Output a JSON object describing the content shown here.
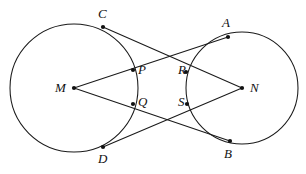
{
  "figure": {
    "width": 306,
    "height": 174,
    "background_color": "#ffffff",
    "stroke_color": "#1a1a1a",
    "label_color": "#111111"
  },
  "labels": {
    "C": "C",
    "A": "A",
    "M": "M",
    "P": "P",
    "R": "R",
    "N": "N",
    "Q": "Q",
    "S": "S",
    "D": "D",
    "B": "B"
  },
  "chart_data": {
    "type": "diagram",
    "circles": [
      {
        "name": "left-circle",
        "center_label": "M",
        "cx": 74,
        "cy": 88,
        "r": 64
      },
      {
        "name": "right-circle",
        "center_label": "N",
        "cx": 242,
        "cy": 88,
        "r": 56
      }
    ],
    "points": [
      {
        "label": "C",
        "x": 103,
        "y": 27,
        "on": "left-circle",
        "label_x": 98,
        "label_y": 7
      },
      {
        "label": "A",
        "x": 228,
        "y": 37,
        "on": "right-circle",
        "label_x": 222,
        "label_y": 16
      },
      {
        "label": "M",
        "x": 74,
        "y": 88,
        "on": "center",
        "label_x": 55,
        "label_y": 81
      },
      {
        "label": "N",
        "x": 242,
        "y": 88,
        "on": "center",
        "label_x": 250,
        "label_y": 81
      },
      {
        "label": "P",
        "x": 133,
        "y": 70,
        "on": "left-circle",
        "label_x": 138,
        "label_y": 63
      },
      {
        "label": "R",
        "x": 186,
        "y": 72,
        "on": "right-circle",
        "label_x": 178,
        "label_y": 63
      },
      {
        "label": "Q",
        "x": 133,
        "y": 104,
        "on": "left-circle",
        "label_x": 138,
        "label_y": 95
      },
      {
        "label": "S",
        "x": 187,
        "y": 104,
        "on": "right-circle",
        "label_x": 178,
        "label_y": 95
      },
      {
        "label": "D",
        "x": 103,
        "y": 147,
        "on": "left-circle",
        "label_x": 98,
        "label_y": 152
      },
      {
        "label": "B",
        "x": 230,
        "y": 141,
        "on": "right-circle",
        "label_x": 224,
        "label_y": 147
      }
    ],
    "segments": [
      {
        "name": "M-to-A",
        "from": "M",
        "to": "A",
        "x1": 74,
        "y1": 88,
        "x2": 228,
        "y2": 37,
        "passes_through": [
          "P",
          "R"
        ]
      },
      {
        "name": "M-to-B",
        "from": "M",
        "to": "B",
        "x1": 74,
        "y1": 88,
        "x2": 230,
        "y2": 141,
        "passes_through": [
          "Q",
          "S"
        ]
      },
      {
        "name": "N-to-C",
        "from": "N",
        "to": "C",
        "x1": 242,
        "y1": 88,
        "x2": 103,
        "y2": 27,
        "passes_through": [
          "R",
          "P"
        ]
      },
      {
        "name": "N-to-D",
        "from": "N",
        "to": "D",
        "x1": 242,
        "y1": 88,
        "x2": 103,
        "y2": 147,
        "passes_through": [
          "S",
          "Q"
        ]
      }
    ]
  }
}
